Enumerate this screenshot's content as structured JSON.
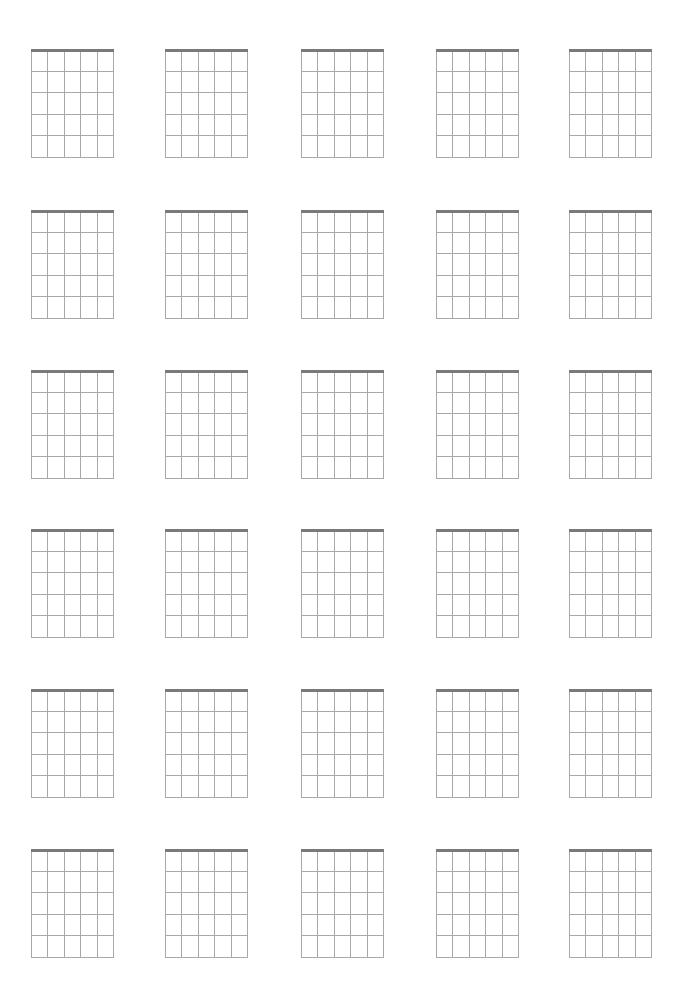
{
  "sheet": {
    "type": "blank-chord-chart",
    "rows": 6,
    "columns": 5,
    "strings_per_diagram": 6,
    "frets_per_diagram": 5,
    "column_x": [
      31,
      165,
      301,
      436,
      569
    ],
    "row_y": [
      49,
      210,
      370,
      529,
      689,
      849
    ],
    "diagram_width": 82,
    "diagram_height": 108,
    "colors": {
      "nut": "#7a7a7a",
      "line": "#a8a8a8",
      "background": "#ffffff"
    }
  }
}
